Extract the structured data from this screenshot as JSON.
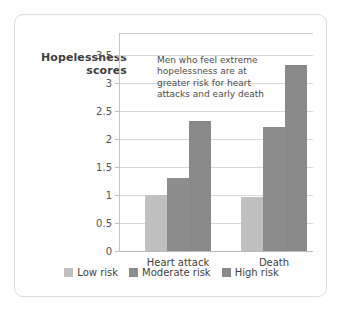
{
  "card": {
    "border_color": "#dcdcdc",
    "background": "#ffffff"
  },
  "chart_data": {
    "type": "bar",
    "title": "",
    "subtitle": "",
    "xlabel": "",
    "ylabel": "Hopelessness scores",
    "ylabel_lines": [
      "Hopelessness",
      "scores"
    ],
    "categories": [
      "Heart attack",
      "Death"
    ],
    "series": [
      {
        "name": "Low risk",
        "color": "#c0c0c0",
        "values": [
          1.0,
          0.97
        ]
      },
      {
        "name": "Moderate risk",
        "color": "#8d8d8d",
        "values": [
          1.3,
          2.22
        ]
      },
      {
        "name": "High risk",
        "color": "#8a8a8a",
        "values": [
          2.33,
          3.33
        ]
      }
    ],
    "ylim": [
      0,
      3.9
    ],
    "yticks": [
      0,
      0.5,
      1,
      1.5,
      2,
      2.5,
      3,
      3.5
    ],
    "ytick_labels": [
      "0",
      "0.5",
      "1",
      "1.5",
      "2",
      "2.5",
      "3",
      "3.5"
    ],
    "grid": true,
    "grid_axis": "y",
    "legend_position": "bottom",
    "annotations": [
      {
        "text": "Men who feel extreme hopelessness are at greater risk for heart attacks and early death",
        "lines": [
          "Men who feel extreme",
          "hopelessness are at",
          "greater risk for heart",
          "attacks and early death"
        ]
      }
    ]
  },
  "legend": {
    "items": [
      {
        "label": "Low risk",
        "color": "#c0c0c0"
      },
      {
        "label": "Moderate risk",
        "color": "#8d8d8d"
      },
      {
        "label": "High risk",
        "color": "#8a8a8a"
      }
    ]
  },
  "axis": {
    "y_title_line1": "Hopelessness",
    "y_title_line2": "scores"
  }
}
